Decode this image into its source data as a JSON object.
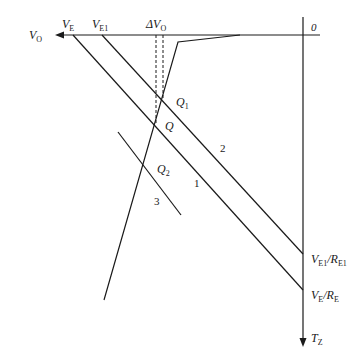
{
  "diagram": {
    "type": "load-line graph",
    "axes": {
      "origin_label": "0",
      "horizontal_axis_label": "V",
      "horizontal_axis_label_sub": "O",
      "vertical_axis_label": "T",
      "vertical_axis_label_sub": "Z"
    },
    "top_labels": {
      "ve": {
        "main": "V",
        "sub": "E"
      },
      "ve1": {
        "main": "V",
        "sub": "E1"
      },
      "delta_vo": {
        "main": "ΔV",
        "sub": "O"
      }
    },
    "right_labels": {
      "ve1_re1": {
        "main": "V",
        "sub": "E1",
        "sep": "/R",
        "sub2": "E1"
      },
      "ve_re": {
        "main": "V",
        "sub": "E",
        "sep": "/R",
        "sub2": "E"
      }
    },
    "points": {
      "q1": {
        "main": "Q",
        "sub": "1"
      },
      "q": {
        "main": "Q",
        "sub": ""
      },
      "q2": {
        "main": "Q",
        "sub": "2"
      }
    },
    "line_numbers": {
      "line1": "1",
      "line2": "2",
      "line3": "3"
    },
    "colors": {
      "line": "#1a1a1a",
      "background": "#ffffff"
    }
  }
}
